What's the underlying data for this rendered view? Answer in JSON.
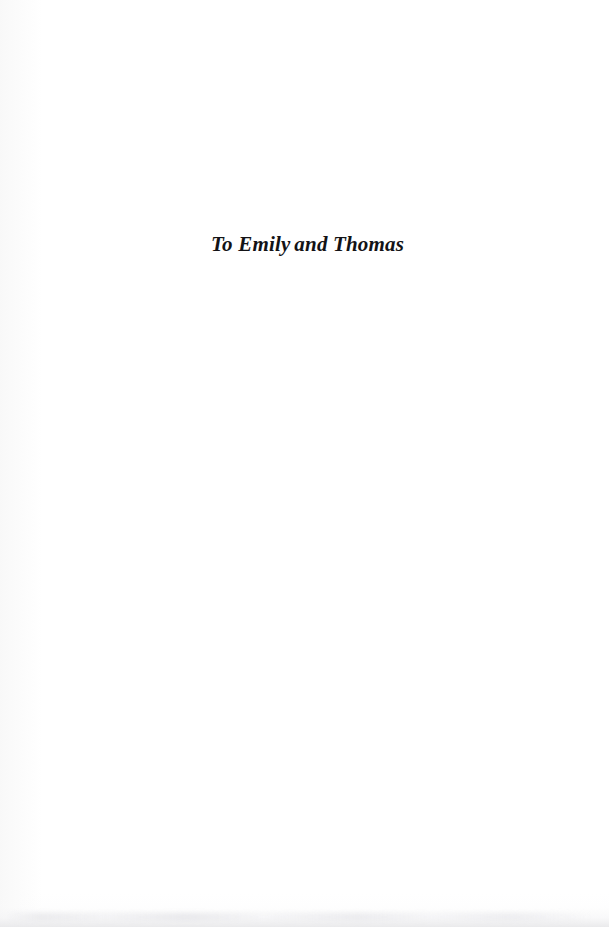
{
  "page": {
    "type": "book-dedication-page",
    "background_color": "#ffffff",
    "ink_color": "#131316",
    "width": 609,
    "height": 927
  },
  "dedication": {
    "full_text": "To Emily and Thomas",
    "lead_in": "To Emily",
    "trailing": " and Thomas",
    "style": "bold-italic-serif",
    "alignment": "centered"
  }
}
